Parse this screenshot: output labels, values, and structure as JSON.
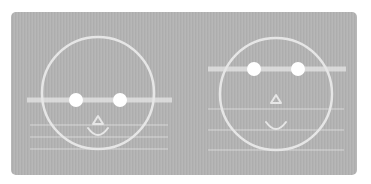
{
  "figure": {
    "panel_color": "#b3b3b3",
    "stroke_color": "#e6e6e6",
    "eye_color": "#ffffff",
    "faces": [
      {
        "name": "left-face",
        "circle": {
          "cx": 98,
          "cy": 93,
          "r": 56
        },
        "eye_bar": {
          "x1": 27,
          "x2": 172,
          "y": 100,
          "thickness": 5
        },
        "eyes": [
          {
            "cx": 76,
            "cy": 100,
            "r": 7
          },
          {
            "cx": 120,
            "cy": 100,
            "r": 7
          }
        ],
        "nose": {
          "cx": 98,
          "cy": 121
        },
        "mouth": {
          "cx": 98,
          "cy": 131
        },
        "guide_lines": [
          125,
          137,
          149
        ],
        "guide_x1": 30,
        "guide_x2": 168
      },
      {
        "name": "right-face",
        "circle": {
          "cx": 276,
          "cy": 94,
          "r": 56
        },
        "eye_bar": {
          "x1": 208,
          "x2": 346,
          "y": 69,
          "thickness": 5
        },
        "eyes": [
          {
            "cx": 254,
            "cy": 69,
            "r": 7
          },
          {
            "cx": 298,
            "cy": 69,
            "r": 7
          }
        ],
        "nose": {
          "cx": 276,
          "cy": 100
        },
        "mouth": {
          "cx": 276,
          "cy": 125
        },
        "guide_lines": [
          109,
          130,
          150
        ],
        "guide_x1": 208,
        "guide_x2": 344
      }
    ]
  }
}
